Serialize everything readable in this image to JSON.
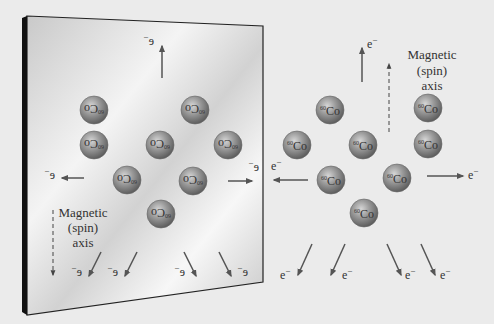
{
  "diagram": {
    "colors": {
      "background": "#ebebeb",
      "mirror_frame": "#1a1a1a",
      "sphere": "#8f8f8f",
      "arrow": "#555555",
      "text": "#333333"
    },
    "real_world": {
      "isotope_label": "Co",
      "isotope_mass": "60",
      "electron_label": "e",
      "electron_charge": "−",
      "axis_label": [
        "Magnetic",
        "(spin)",
        "axis"
      ],
      "axis_direction": "up"
    },
    "mirror_world": {
      "isotope_label": "Co",
      "isotope_mass": "60",
      "electron_label": "e",
      "electron_charge": "−",
      "axis_label": [
        "Magnetic",
        "(spin)",
        "axis"
      ],
      "axis_direction": "down",
      "text_mirrored": true
    }
  }
}
